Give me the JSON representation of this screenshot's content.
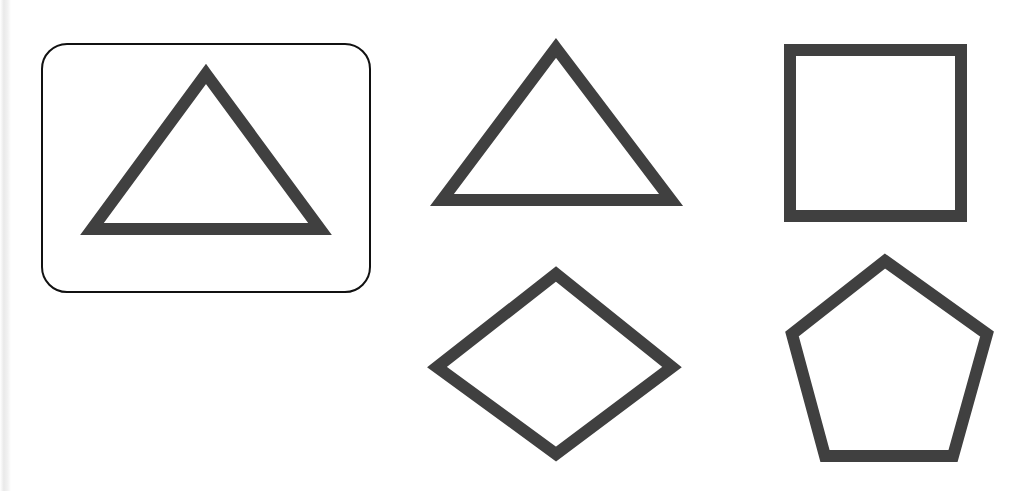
{
  "canvas": {
    "width": 1027,
    "height": 491,
    "background_color": "#ffffff",
    "description": "Line drawing worksheet: five outlined geometric shapes on a white background; the first shape is enclosed in a rounded rectangle box."
  },
  "style": {
    "shape_stroke_color": "#404040",
    "shape_stroke_width": 12,
    "shape_fill": "none",
    "box_stroke_color": "#111111",
    "box_stroke_width": 2,
    "box_corner_radius": 26
  },
  "scan_edge": {
    "present": true,
    "color": "#e9e9e9"
  },
  "group_box": {
    "label": "rounded-rectangle-frame",
    "x": 41,
    "y": 43,
    "width": 330,
    "height": 250
  },
  "shapes": [
    {
      "name": "triangle-boxed",
      "type": "triangle",
      "sides": 3,
      "boxed": true,
      "points": "206,74 320,229 92,229",
      "bounds": {
        "x": 86,
        "y": 68,
        "width": 240,
        "height": 167
      }
    },
    {
      "name": "triangle",
      "type": "triangle",
      "sides": 3,
      "boxed": false,
      "points": "556,48 671,200 442,200",
      "bounds": {
        "x": 436,
        "y": 42,
        "width": 241,
        "height": 164
      }
    },
    {
      "name": "square",
      "type": "square",
      "sides": 4,
      "boxed": false,
      "points": "790,50 961,50 961,216 790,216",
      "bounds": {
        "x": 784,
        "y": 44,
        "width": 183,
        "height": 178
      }
    },
    {
      "name": "rhombus",
      "type": "rhombus",
      "sides": 4,
      "boxed": false,
      "points": "556,274 672,367 556,454 437,367",
      "bounds": {
        "x": 431,
        "y": 268,
        "width": 247,
        "height": 192
      }
    },
    {
      "name": "pentagon",
      "type": "pentagon",
      "sides": 5,
      "boxed": false,
      "points": "885,261 987,334 953,456 825,456 792,334",
      "bounds": {
        "x": 786,
        "y": 255,
        "width": 207,
        "height": 207
      }
    }
  ]
}
